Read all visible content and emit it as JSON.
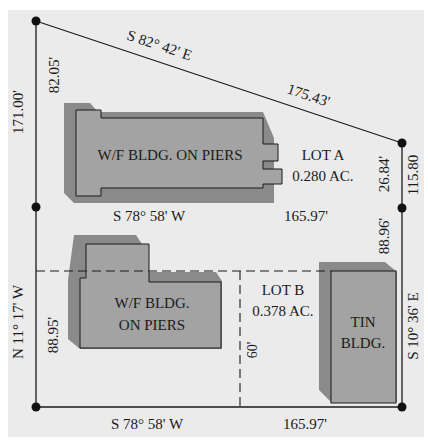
{
  "colors": {
    "background": "#ebebeb",
    "line": "#1a1a1a",
    "building_fill": "#a3a3a3",
    "building_shadow": "#8a8a8a"
  },
  "boundary": {
    "north_bearing": "S 82° 42' E",
    "north_distance": "175.43'",
    "west_upper_distance": "82.05'",
    "west_total_distance": "171.00'",
    "west_bearing": "N 11° 17' W",
    "west_lower_distance": "88.95'",
    "east_upper_distance": "26.84'",
    "east_total_distance": "115.80",
    "east_lower_distance": "88.96'",
    "east_bearing": "S 10° 36' E",
    "divider_bearing": "S 78° 58' W",
    "divider_distance": "165.97'",
    "south_bearing": "S 78° 58' W",
    "south_distance": "165.97'",
    "easement_width": "60'"
  },
  "lots": [
    {
      "name": "LOT A",
      "area": "0.280 AC."
    },
    {
      "name": "LOT B",
      "area": "0.378 AC."
    }
  ],
  "buildings": {
    "lot_a_building": "W/F BLDG. ON PIERS",
    "lot_b_building_line1": "W/F BLDG.",
    "lot_b_building_line2": "ON PIERS",
    "tin_building_line1": "TIN",
    "tin_building_line2": "BLDG."
  }
}
